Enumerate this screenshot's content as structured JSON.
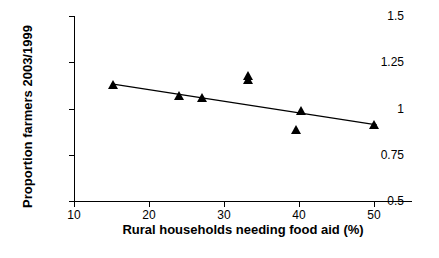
{
  "chart_data": {
    "type": "scatter",
    "title": "",
    "xlabel": "Rural households needing food aid (%)",
    "ylabel": "Proportion farmers 2003/1999",
    "xlim": [
      10,
      55
    ],
    "ylim": [
      0.5,
      1.5
    ],
    "xticks": [
      10,
      20,
      30,
      40,
      50
    ],
    "yticks": [
      "0.5",
      "0.75",
      "1",
      "1.25",
      "1.5"
    ],
    "ytick_values": [
      0.5,
      0.75,
      1.0,
      1.25,
      1.5
    ],
    "grid": false,
    "legend": false,
    "marker": "triangle",
    "marker_color": "#000000",
    "points": [
      {
        "x": 15.2,
        "y": 1.13
      },
      {
        "x": 24.0,
        "y": 1.07
      },
      {
        "x": 27.0,
        "y": 1.06
      },
      {
        "x": 33.2,
        "y": 1.18
      },
      {
        "x": 33.2,
        "y": 1.155
      },
      {
        "x": 39.6,
        "y": 0.885
      },
      {
        "x": 40.2,
        "y": 0.99
      },
      {
        "x": 50.0,
        "y": 0.915
      }
    ],
    "series": [
      {
        "name": "trendline",
        "type": "line",
        "points": [
          {
            "x": 15.0,
            "y": 1.135
          },
          {
            "x": 50.3,
            "y": 0.915
          }
        ]
      }
    ]
  }
}
